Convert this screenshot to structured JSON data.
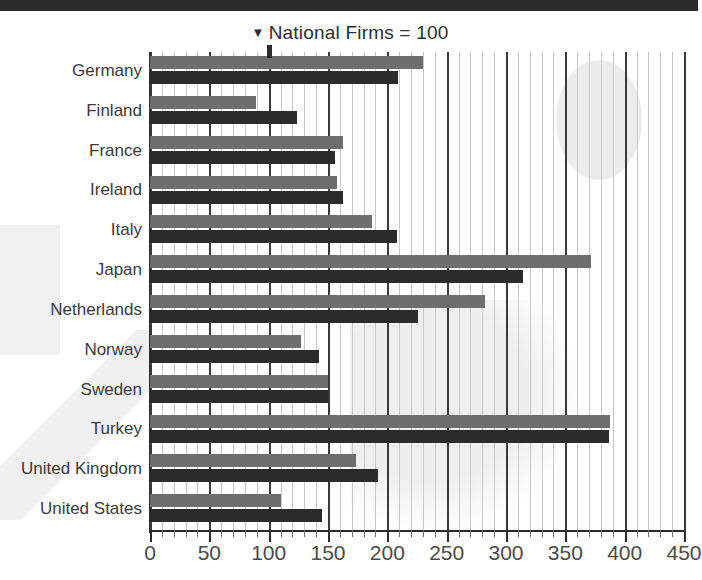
{
  "chart_data": {
    "type": "bar",
    "orientation": "horizontal",
    "title": "National Firms = 100",
    "title_marker": "▼",
    "xlabel": "",
    "ylabel": "",
    "xlim": [
      0,
      450
    ],
    "xticks": [
      0,
      50,
      100,
      150,
      200,
      250,
      300,
      350,
      400,
      450
    ],
    "xtick_labels": [
      "0",
      "50",
      "100",
      "150",
      "200",
      "250",
      "300",
      "350",
      "400",
      "450"
    ],
    "minor_tick_step": 10,
    "grid": true,
    "grid_axis": "x",
    "legend": "none",
    "reference_value": 100,
    "categories": [
      "Germany",
      "Finland",
      "France",
      "Ireland",
      "Italy",
      "Japan",
      "Netherlands",
      "Norway",
      "Sweden",
      "Turkey",
      "United Kingdom",
      "United States"
    ],
    "series": [
      {
        "name": "light-series",
        "color": "#6e6e6e",
        "values": [
          230,
          89,
          163,
          158,
          187,
          372,
          282,
          127,
          150,
          388,
          174,
          110
        ]
      },
      {
        "name": "dark-series",
        "color": "#2b2b2b",
        "values": [
          209,
          124,
          156,
          163,
          208,
          314,
          226,
          142,
          150,
          387,
          192,
          145
        ]
      }
    ]
  },
  "colors": {
    "light_bar": "#6e6e6e",
    "dark_bar": "#2b2b2b",
    "gridline_minor": "#c9c9c9",
    "gridline_major": "#3a3a3a",
    "background": "#ffffff",
    "text": "#3a3a3a"
  }
}
